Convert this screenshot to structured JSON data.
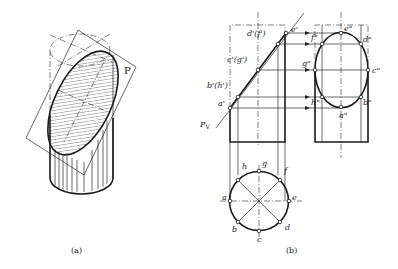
{
  "figure_a": {
    "caption": "(a)",
    "plane_label": "P"
  },
  "figure_b": {
    "caption": "(b)",
    "plane_trace_label": "P",
    "plane_trace_subscript": "V",
    "front_view_labels": {
      "e": "e'",
      "d_f": "d'(f')",
      "c_g": "c'(g')",
      "b_h": "b'(h')",
      "a": "a'"
    },
    "side_view_labels": {
      "e": "e\"",
      "d": "d\"",
      "f": "f\"",
      "g": "g\"",
      "c": "c\"",
      "h": "h\"",
      "b": "b\"",
      "a": "a\""
    },
    "top_view_labels": {
      "a": "a",
      "b": "b",
      "c": "c",
      "d": "d",
      "e": "e",
      "f": "f",
      "g": "g",
      "h": "h"
    }
  }
}
